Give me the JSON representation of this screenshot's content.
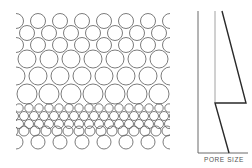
{
  "diagram": {
    "colors": {
      "stroke": "#5a5a5a",
      "profile": "#2a2a2a",
      "background": "#ffffff"
    },
    "packing": {
      "clip": {
        "x": 16,
        "y": 10,
        "w": 154,
        "h": 142
      },
      "rows": [
        {
          "y": 21,
          "r": 7.5,
          "x0": 16,
          "dx": 22
        },
        {
          "y": 33,
          "r": 7.5,
          "x0": 27,
          "dx": 22
        },
        {
          "y": 45,
          "r": 7.5,
          "x0": 16,
          "dx": 22
        },
        {
          "y": 59,
          "r": 9,
          "x0": 27,
          "dx": 22
        },
        {
          "y": 76,
          "r": 9,
          "x0": 38,
          "dx": 22
        },
        {
          "y": 94,
          "r": 10,
          "x0": 27,
          "dx": 22
        },
        {
          "y": 108,
          "r": 4.2,
          "x0": 19,
          "dx": 10
        },
        {
          "y": 116,
          "r": 4.5,
          "x0": 24,
          "dx": 10
        },
        {
          "y": 124,
          "r": 4.5,
          "x0": 19,
          "dx": 10
        },
        {
          "y": 131,
          "r": 5,
          "x0": 24,
          "dx": 11
        },
        {
          "y": 142,
          "r": 7,
          "x0": 16,
          "dx": 22
        }
      ]
    },
    "profile": {
      "axis": {
        "x": 198,
        "top": 11,
        "bottom": 153,
        "right": 248
      },
      "reference_line": {
        "x": 215,
        "top": 11,
        "bottom": 102
      },
      "curve": [
        [
          222,
          11
        ],
        [
          246,
          103
        ],
        [
          215,
          103
        ],
        [
          229,
          153
        ]
      ],
      "xlabel": "PORE SIZE"
    }
  }
}
